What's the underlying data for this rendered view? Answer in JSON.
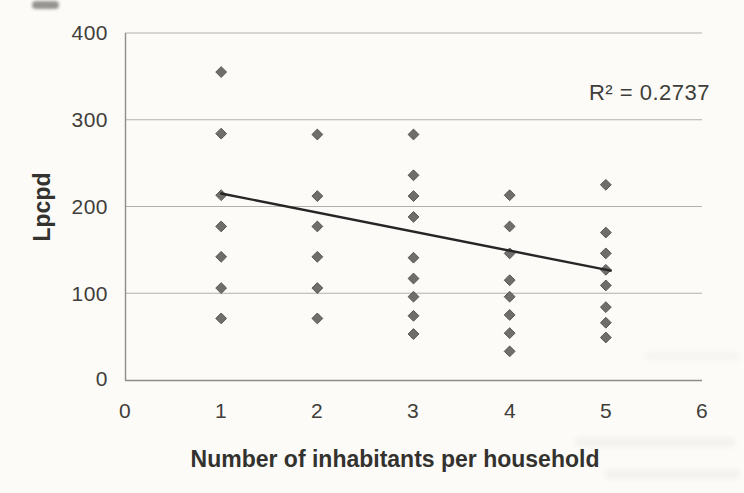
{
  "chart_data": {
    "type": "scatter",
    "title": "",
    "xlabel": "Number of inhabitants per household",
    "ylabel": "Lpcpd",
    "annotation": "R² = 0.2737",
    "r_squared": 0.2737,
    "xlim": [
      0,
      6
    ],
    "ylim": [
      0,
      400
    ],
    "x_ticks": [
      "0",
      "1",
      "2",
      "3",
      "4",
      "5",
      "6"
    ],
    "y_ticks": [
      "400",
      "300",
      "200",
      "100",
      "0"
    ],
    "grid": "horizontal-gridlines-only",
    "legend": "none",
    "marker": "diamond",
    "series": [
      {
        "name": "Lpcpd per household size",
        "points": [
          [
            1,
            355
          ],
          [
            1,
            284
          ],
          [
            1,
            213
          ],
          [
            1,
            177
          ],
          [
            1,
            142
          ],
          [
            1,
            106
          ],
          [
            1,
            71
          ],
          [
            2,
            283
          ],
          [
            2,
            212
          ],
          [
            2,
            177
          ],
          [
            2,
            142
          ],
          [
            2,
            106
          ],
          [
            2,
            71
          ],
          [
            3,
            283
          ],
          [
            3,
            236
          ],
          [
            3,
            212
          ],
          [
            3,
            188
          ],
          [
            3,
            141
          ],
          [
            3,
            117
          ],
          [
            3,
            96
          ],
          [
            3,
            74
          ],
          [
            3,
            53
          ],
          [
            4,
            213
          ],
          [
            4,
            177
          ],
          [
            4,
            146
          ],
          [
            4,
            115
          ],
          [
            4,
            96
          ],
          [
            4,
            75
          ],
          [
            4,
            54
          ],
          [
            4,
            33
          ],
          [
            5,
            225
          ],
          [
            5,
            170
          ],
          [
            5,
            146
          ],
          [
            5,
            127
          ],
          [
            5,
            109
          ],
          [
            5,
            84
          ],
          [
            5,
            66
          ],
          [
            5,
            49
          ]
        ]
      }
    ],
    "trendline": {
      "x1": 1.0,
      "y1": 215,
      "x2": 5.05,
      "y2": 126
    }
  },
  "colors": {
    "background": "#fcfbf7",
    "marker_fill": "#6f6e6b",
    "marker_stroke": "#585755",
    "gridline": "#b3b1ad",
    "axis": "#8f8d89",
    "trendline": "#262626",
    "text": "#3b3a37"
  }
}
